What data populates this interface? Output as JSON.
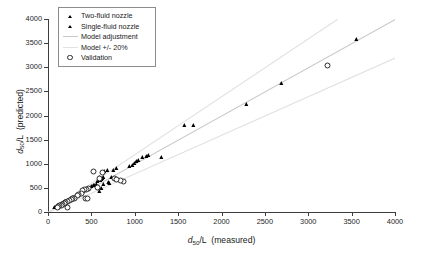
{
  "chart_data": {
    "type": "scatter",
    "title": "",
    "xlabel": "d50/L (measured)",
    "ylabel": "d50/L (predicted)",
    "xlim": [
      0,
      4000
    ],
    "ylim": [
      0,
      4000
    ],
    "xticks": [
      0,
      500,
      1000,
      1500,
      2000,
      2500,
      3000,
      3500,
      4000
    ],
    "yticks": [
      0,
      500,
      1000,
      1500,
      2000,
      2500,
      3000,
      3500,
      4000
    ],
    "grid": false,
    "legend_position": "upper-left-inside",
    "series": [
      {
        "name": "Two-fluid nozzle",
        "marker": "filled-triangle",
        "color": "#000000",
        "points": [
          [
            1580,
            1780
          ],
          [
            1680,
            1775
          ],
          [
            2290,
            2220
          ],
          [
            2700,
            2650
          ],
          [
            3560,
            3560
          ],
          [
            1310,
            1110
          ],
          [
            1160,
            1160
          ],
          [
            1140,
            1130
          ],
          [
            1090,
            1120
          ],
          [
            1050,
            1060
          ],
          [
            1030,
            1030
          ],
          [
            1000,
            1000
          ],
          [
            975,
            950
          ],
          [
            940,
            935
          ],
          [
            800,
            890
          ],
          [
            760,
            840
          ],
          [
            735,
            700
          ],
          [
            710,
            575
          ],
          [
            690,
            840
          ],
          [
            660,
            820
          ],
          [
            650,
            800
          ],
          [
            640,
            700
          ],
          [
            630,
            690
          ],
          [
            625,
            660
          ],
          [
            615,
            650
          ],
          [
            600,
            640
          ],
          [
            595,
            700
          ],
          [
            580,
            620
          ],
          [
            560,
            560
          ],
          [
            545,
            545
          ],
          [
            530,
            530
          ],
          [
            505,
            510
          ],
          [
            470,
            470
          ],
          [
            450,
            455
          ],
          [
            430,
            425
          ],
          [
            415,
            405
          ]
        ]
      },
      {
        "name": "Single-fluid nozzle",
        "marker": "filled-triangle",
        "color": "#000000",
        "points": [
          [
            400,
            390
          ],
          [
            385,
            375
          ],
          [
            370,
            360
          ],
          [
            355,
            350
          ],
          [
            345,
            330
          ],
          [
            335,
            320
          ],
          [
            320,
            315
          ],
          [
            310,
            300
          ],
          [
            300,
            290
          ],
          [
            290,
            285
          ],
          [
            280,
            270
          ],
          [
            270,
            265
          ],
          [
            260,
            255
          ],
          [
            250,
            245
          ],
          [
            240,
            235
          ],
          [
            230,
            225
          ],
          [
            220,
            215
          ],
          [
            210,
            205
          ],
          [
            200,
            200
          ],
          [
            190,
            190
          ],
          [
            180,
            180
          ],
          [
            170,
            170
          ],
          [
            160,
            160
          ],
          [
            150,
            150
          ],
          [
            140,
            140
          ],
          [
            130,
            130
          ],
          [
            120,
            120
          ],
          [
            110,
            110
          ],
          [
            100,
            100
          ],
          [
            90,
            90
          ],
          [
            80,
            80
          ],
          [
            600,
            420
          ],
          [
            620,
            470
          ],
          [
            645,
            560
          ],
          [
            700,
            600
          ]
        ]
      },
      {
        "name": "Validation",
        "marker": "open-circle",
        "color": "#2b2b2b",
        "points": [
          [
            3220,
            3040
          ],
          [
            860,
            650
          ],
          [
            830,
            655
          ],
          [
            520,
            840
          ],
          [
            625,
            825
          ],
          [
            460,
            490
          ],
          [
            440,
            485
          ],
          [
            415,
            480
          ],
          [
            395,
            460
          ],
          [
            380,
            390
          ],
          [
            350,
            370
          ],
          [
            330,
            355
          ],
          [
            300,
            300
          ],
          [
            280,
            290
          ],
          [
            430,
            290
          ],
          [
            455,
            295
          ],
          [
            260,
            260
          ],
          [
            240,
            245
          ],
          [
            220,
            225
          ],
          [
            200,
            210
          ],
          [
            180,
            185
          ],
          [
            160,
            165
          ],
          [
            145,
            150
          ],
          [
            130,
            135
          ],
          [
            115,
            120
          ],
          [
            100,
            105
          ],
          [
            215,
            110
          ],
          [
            760,
            705
          ],
          [
            780,
            690
          ],
          [
            585,
            700
          ],
          [
            560,
            520
          ]
        ]
      }
    ],
    "lines": [
      {
        "name": "Model adjustment",
        "color": "#c9c9c9",
        "from": [
          0,
          0
        ],
        "to": [
          4000,
          4000
        ]
      },
      {
        "name": "Model +20%",
        "color": "#e0e0e0",
        "from": [
          0,
          0
        ],
        "to": [
          3333,
          4000
        ]
      },
      {
        "name": "Model -20%",
        "color": "#e0e0e0",
        "from": [
          0,
          0
        ],
        "to": [
          4000,
          3200
        ]
      }
    ]
  },
  "legend": {
    "items": [
      {
        "label": "Two-fluid nozzle",
        "key": "filled-triangle"
      },
      {
        "label": "Single-fluid nozzle",
        "key": "filled-triangle"
      },
      {
        "label": "Model adjustment",
        "key": "line"
      },
      {
        "label": "Model +/- 20%",
        "key": "line-faint"
      },
      {
        "label": "Validation",
        "key": "open-circle"
      }
    ]
  }
}
